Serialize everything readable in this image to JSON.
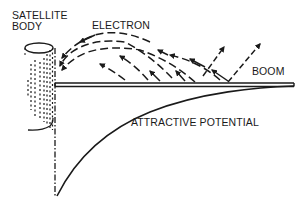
{
  "diagram": {
    "labels": {
      "satellite_body_line1": "SATELLITE",
      "satellite_body_line2": "BODY",
      "electron": "ELECTRON",
      "boom": "BOOM",
      "attractive_potential": "ATTRACTIVE POTENTIAL"
    },
    "colors": {
      "ink": "#1a1a1a",
      "background": "#ffffff"
    },
    "elements": {
      "satellite_body": "cylinder",
      "boom": "horizontal double-line rod",
      "electron_paths": "dashed arrows arcing from boom back to satellite body",
      "escaping_electrons": "dashed arrows leaving boom upward-right",
      "potential_curve": "curve from boom tip descending to minimum at satellite body axis",
      "axis": "dash-dot vertical line at satellite body edge"
    }
  }
}
